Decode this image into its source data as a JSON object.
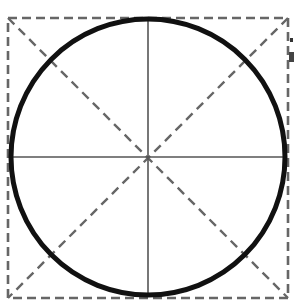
{
  "diagram": {
    "colors": {
      "background": "#ffffff",
      "circle": "#111111",
      "dashed": "#666666",
      "axis": "#555555"
    },
    "square": {
      "x1": 8,
      "y1": 18,
      "x2": 288,
      "y2": 298
    },
    "circle": {
      "cx": 148,
      "cy": 157,
      "rx": 138,
      "ry": 138
    },
    "center": {
      "x": 148,
      "y": 157
    }
  }
}
